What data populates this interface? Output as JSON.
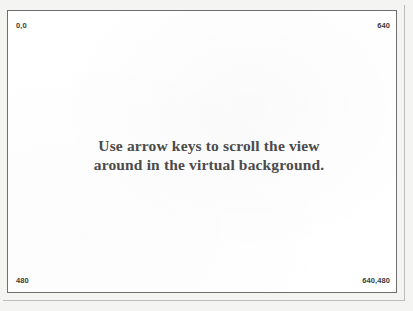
{
  "window": {
    "name": "virtual-background-view",
    "background_color": "#ffffff",
    "border_color": "#6f6f6f",
    "page_color": "#f4f4f2"
  },
  "coordinate_markers": {
    "top_left": "0,0",
    "top_right": "640",
    "bottom_left": "480",
    "bottom_right": "640,480"
  },
  "instruction": {
    "line1": "Use arrow keys to scroll the view",
    "line2": "around in the virtual background.",
    "text_color": "#4b4b4b"
  }
}
